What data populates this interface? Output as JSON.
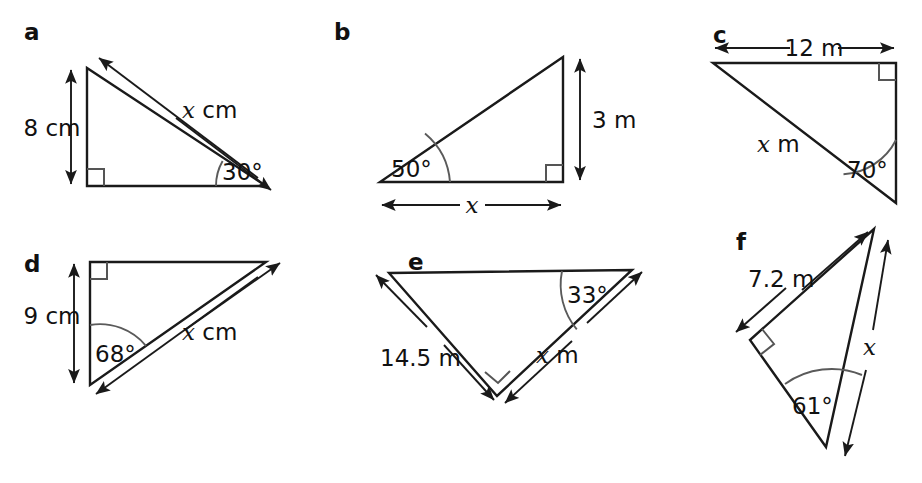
{
  "page": {
    "background_color": "#ffffff",
    "ink_color": "#1a1a1a",
    "arc_color": "#5a5a5a",
    "width": 922,
    "height": 483
  },
  "figures": [
    {
      "letter": "a",
      "known_label": "8 cm",
      "unknown_label": "x cm",
      "unknown_symbol": "x",
      "unknown_unit": "cm",
      "angle_label": "30°",
      "angle_value": 30,
      "known_value": 8,
      "known_unit": "cm",
      "right_angle": true,
      "description": "Right triangle with vertical side 8 cm on the left, right angle at bottom-left, 30 degrees at bottom-right, hypotenuse x cm"
    },
    {
      "letter": "b",
      "known_label": "3 m",
      "unknown_label": "x",
      "unknown_symbol": "x",
      "unknown_unit": "",
      "angle_label": "50°",
      "angle_value": 50,
      "known_value": 3,
      "known_unit": "m",
      "right_angle": true,
      "description": "Right triangle with vertical side 3 m on the right, right angle at bottom-right, 50 degrees at bottom-left, base x"
    },
    {
      "letter": "c",
      "known_label": "12 m",
      "unknown_label": "x m",
      "unknown_symbol": "x",
      "unknown_unit": "m",
      "angle_label": "70°",
      "angle_value": 70,
      "known_value": 12,
      "known_unit": "m",
      "right_angle": true,
      "description": "Right triangle with horizontal top side 12 m, right angle at top-right, 70 degrees at bottom-right, hypotenuse x m"
    },
    {
      "letter": "d",
      "known_label": "9 cm",
      "unknown_label": "x cm",
      "unknown_symbol": "x",
      "unknown_unit": "cm",
      "angle_label": "68°",
      "angle_value": 68,
      "known_value": 9,
      "known_unit": "cm",
      "right_angle": true,
      "description": "Right triangle with vertical side 9 cm on the left, right angle at top-left, 68 degrees at bottom-left, hypotenuse x cm"
    },
    {
      "letter": "e",
      "known_label": "14.5 m",
      "unknown_label": "x m",
      "unknown_symbol": "x",
      "unknown_unit": "m",
      "angle_label": "33°",
      "angle_value": 33,
      "known_value": 14.5,
      "known_unit": "m",
      "right_angle": true,
      "description": "Right triangle pointing down, side 14.5 m on the left, right angle at bottom vertex, 33 degrees at top-right, side x m"
    },
    {
      "letter": "f",
      "known_label": "7.2 m",
      "unknown_label": "x",
      "unknown_symbol": "x",
      "unknown_unit": "",
      "angle_label": "61°",
      "angle_value": 61,
      "known_value": 7.2,
      "known_unit": "m",
      "right_angle": true,
      "description": "Tilted right triangle, side 7.2 m top-left, right angle at left vertex, 61 degrees at bottom vertex, side x on the right"
    }
  ]
}
